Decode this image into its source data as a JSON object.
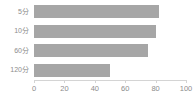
{
  "chart_data": {
    "type": "bar",
    "orientation": "horizontal",
    "title": "",
    "subtitle": "",
    "xlabel": "",
    "ylabel": "",
    "categories": [
      "5分",
      "10分",
      "60分",
      "120分"
    ],
    "values": [
      82,
      80,
      75,
      50
    ],
    "series": [
      {
        "name": "",
        "values": [
          82,
          80,
          75,
          50
        ]
      }
    ],
    "xlim": [
      0,
      100
    ],
    "xticks": [
      0,
      20,
      40,
      60,
      80,
      100
    ],
    "xtick_labels": [
      "0",
      "20",
      "40",
      "60",
      "80",
      "100"
    ],
    "grid": false,
    "legend": false,
    "legend_position": "none",
    "annotations": [],
    "colors": {
      "bar": "#a6a6a6",
      "axis": "#d4d4d4",
      "text": "#8c8c8c",
      "background": "#ffffff"
    }
  }
}
